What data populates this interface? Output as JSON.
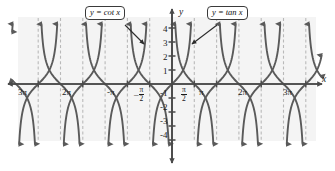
{
  "chart_data": {
    "type": "line",
    "title": "",
    "xlabel": "x",
    "ylabel": "y",
    "grid": false,
    "legend_position": "callout-labels",
    "xlim": [
      -11.0,
      11.0
    ],
    "ylim": [
      -4.6,
      4.6
    ],
    "x_unit": "pi",
    "yticks": [
      4,
      3,
      2,
      1,
      -1,
      -2,
      -3,
      -4
    ],
    "ytick_labels": [
      "4",
      "3",
      "2",
      "1",
      "-1",
      "-2",
      "-3",
      "-4"
    ],
    "xtick_values_pi": [
      -3,
      -2,
      -1,
      -0.5,
      0.5,
      1,
      2,
      3
    ],
    "xtick_labels": [
      "3π",
      "2π",
      "-π",
      "-π/2",
      "π/2",
      "π",
      "2π",
      "3π"
    ],
    "asymptotes_pi": [
      -3.5,
      -3,
      -2.5,
      -2,
      -1.5,
      -1,
      -0.5,
      0,
      0.5,
      1,
      1.5,
      2,
      2.5,
      3,
      3.5
    ],
    "asymptote_style": "dashed",
    "series": [
      {
        "name": "y = cot x",
        "function": "cot",
        "asymptotes_pi": [
          -3,
          -2,
          -1,
          0,
          1,
          2,
          3
        ],
        "color": "#5a5a5a",
        "zeros_pi": [
          -2.5,
          -1.5,
          -0.5,
          0.5,
          1.5,
          2.5
        ]
      },
      {
        "name": "y = tan x",
        "function": "tan",
        "asymptotes_pi": [
          -3.5,
          -2.5,
          -1.5,
          -0.5,
          0.5,
          1.5,
          2.5,
          3.5
        ],
        "color": "#5a5a5a",
        "zeros_pi": [
          -3,
          -2,
          -1,
          0,
          1,
          2,
          3
        ]
      }
    ],
    "annotations": [
      {
        "text": "y = cot x",
        "target_pi": -0.62,
        "target_y": 2.35
      },
      {
        "text": "y = tan x",
        "target_pi": 0.3,
        "target_y": 2.1
      }
    ]
  },
  "labels": {
    "cot_label": "y = cot x",
    "tan_label": "y = tan x",
    "x_axis": "x",
    "y_axis": "y",
    "y4": "4",
    "y3": "3",
    "y2": "2",
    "y1": "1",
    "ym1": "-1",
    "ym2": "-2",
    "ym3": "-3",
    "ym4": "-4",
    "x_m3pi": "3π",
    "x_m2pi": "2π",
    "x_mpi": "-π",
    "x_mhalfpi_sign": "–",
    "x_halfpi_num": "π",
    "x_halfpi_den": "2",
    "x_pi": "π",
    "x_2pi": "2π",
    "x_3pi": "3π"
  },
  "colors": {
    "curve": "#5a5a5a",
    "axis": "#4a4a4a",
    "asymptote": "#b9b9b9",
    "panel": "#f4f4f4",
    "text": "#1a1a1a"
  }
}
